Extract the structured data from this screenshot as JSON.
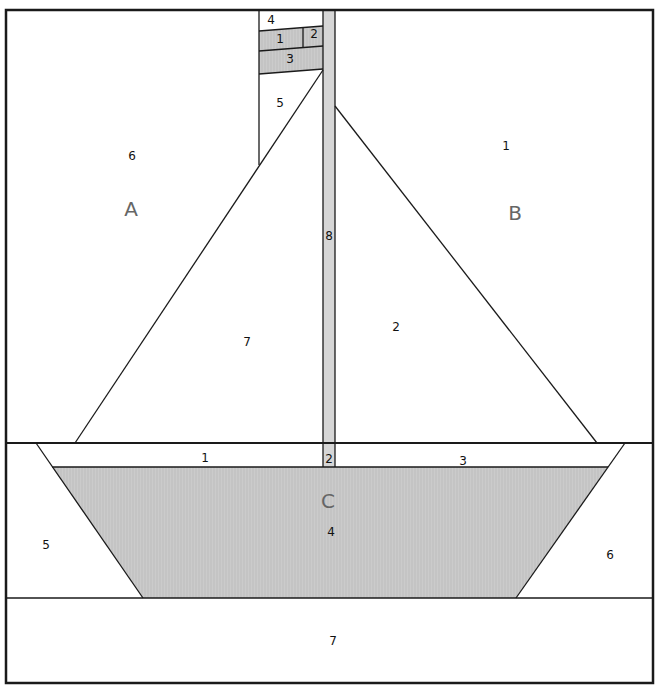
{
  "colors": {
    "line": "#1a1a1a",
    "background": "#ffffff",
    "shaded": "#c8c8c8",
    "pole": "#d4d4d4",
    "section_label": "#666666",
    "piece_label": "#111111"
  },
  "sections": {
    "A": {
      "label": "A",
      "pieces": [
        {
          "id": "1",
          "label": "1"
        },
        {
          "id": "2",
          "label": "2"
        },
        {
          "id": "3",
          "label": "3"
        },
        {
          "id": "4",
          "label": "4"
        },
        {
          "id": "5",
          "label": "5"
        },
        {
          "id": "6",
          "label": "6"
        },
        {
          "id": "7",
          "label": "7"
        },
        {
          "id": "8",
          "label": "8"
        }
      ]
    },
    "B": {
      "label": "B",
      "pieces": [
        {
          "id": "1",
          "label": "1"
        },
        {
          "id": "2",
          "label": "2"
        }
      ]
    },
    "C": {
      "label": "C",
      "pieces": [
        {
          "id": "1",
          "label": "1"
        },
        {
          "id": "2",
          "label": "2"
        },
        {
          "id": "3",
          "label": "3"
        },
        {
          "id": "4",
          "label": "4"
        },
        {
          "id": "5",
          "label": "5"
        },
        {
          "id": "6",
          "label": "6"
        },
        {
          "id": "7",
          "label": "7"
        }
      ]
    }
  }
}
